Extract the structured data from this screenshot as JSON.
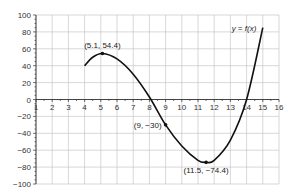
{
  "chart_data": {
    "type": "line",
    "title": "",
    "xlabel": "",
    "ylabel": "",
    "xlim": [
      1,
      16
    ],
    "ylim": [
      -100,
      100
    ],
    "x_ticks": [
      1,
      2,
      3,
      4,
      5,
      6,
      7,
      8,
      9,
      10,
      11,
      12,
      13,
      14,
      15,
      16
    ],
    "y_ticks": [
      100,
      80,
      60,
      40,
      20,
      0,
      -20,
      -40,
      -60,
      -80,
      -100
    ],
    "grid": true,
    "series": [
      {
        "name": "y = f(x)",
        "x": [
          4,
          4.5,
          5.1,
          6,
          7,
          8,
          9,
          10,
          11,
          11.5,
          12,
          13,
          14,
          15
        ],
        "y": [
          40,
          50,
          54.4,
          48,
          30,
          3,
          -30,
          -55,
          -72,
          -74.4,
          -72,
          -48,
          0,
          85
        ]
      }
    ],
    "annotations": [
      {
        "text": "(5.1, 54.4)",
        "x": 5.1,
        "y": 54.4
      },
      {
        "text": "(9, −30)",
        "x": 9,
        "y": -30
      },
      {
        "text": "(11.5, −74.4)",
        "x": 11.5,
        "y": -74.4
      }
    ],
    "curve_label": "y = f(x)"
  }
}
